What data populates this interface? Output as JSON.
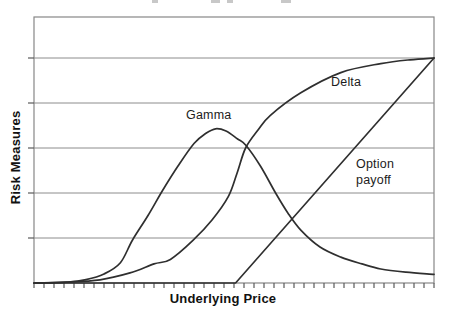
{
  "figure": {
    "background": "#ffffff",
    "frame_color": "#878787",
    "grid_color": "#8c8c8c",
    "tick_color": "#5a5a5a",
    "curve_color": "#2f2f2f",
    "text_color": "#1c1c1c"
  },
  "labels": {
    "y_axis": "Risk Measures",
    "x_axis": "Underlying Price",
    "delta": "Delta",
    "gamma": "Gamma",
    "payoff": "Option\npayoff"
  },
  "chart_data": {
    "type": "line",
    "title": "",
    "xlabel": "Underlying Price",
    "ylabel": "Risk Measures",
    "grid": "horizontal-only",
    "legend": "inline-annotations",
    "x_axis": {
      "range": [
        0,
        100
      ],
      "tick_count": 41,
      "tick_labels": "none"
    },
    "y_axis": {
      "range": [
        0,
        1.182
      ],
      "gridlines": [
        0.2,
        0.4,
        0.6,
        0.8,
        1.0
      ],
      "tick_labels": "none"
    },
    "series": [
      {
        "name": "Delta",
        "smooth": true,
        "points": [
          [
            0,
            0
          ],
          [
            8,
            0.004
          ],
          [
            16.5,
            0.014
          ],
          [
            24,
            0.045
          ],
          [
            30,
            0.085
          ],
          [
            34.1,
            0.105
          ],
          [
            39.8,
            0.19
          ],
          [
            44.5,
            0.28
          ],
          [
            48.6,
            0.385
          ],
          [
            50.8,
            0.49
          ],
          [
            52.9,
            0.6
          ],
          [
            56,
            0.68
          ],
          [
            59.1,
            0.745
          ],
          [
            66.7,
            0.845
          ],
          [
            76.7,
            0.935
          ],
          [
            86.7,
            0.975
          ],
          [
            94,
            0.992
          ],
          [
            100,
            1.0
          ]
        ]
      },
      {
        "name": "Gamma",
        "smooth": true,
        "points": [
          [
            0,
            0
          ],
          [
            8.5,
            0.004
          ],
          [
            13,
            0.015
          ],
          [
            17.5,
            0.04
          ],
          [
            21.6,
            0.09
          ],
          [
            24.6,
            0.19
          ],
          [
            28.5,
            0.3
          ],
          [
            32.1,
            0.41
          ],
          [
            36,
            0.52
          ],
          [
            40,
            0.62
          ],
          [
            43,
            0.665
          ],
          [
            45.4,
            0.685
          ],
          [
            48,
            0.675
          ],
          [
            50.9,
            0.64
          ],
          [
            52.9,
            0.613
          ],
          [
            56.6,
            0.52
          ],
          [
            60.4,
            0.4
          ],
          [
            63.5,
            0.31
          ],
          [
            66.7,
            0.235
          ],
          [
            71.5,
            0.16
          ],
          [
            76.7,
            0.115
          ],
          [
            82,
            0.085
          ],
          [
            86.7,
            0.062
          ],
          [
            93,
            0.048
          ],
          [
            100,
            0.038
          ]
        ]
      },
      {
        "name": "Option payoff",
        "smooth": false,
        "points": [
          [
            0,
            0
          ],
          [
            50.4,
            0
          ],
          [
            100,
            1.0
          ]
        ]
      }
    ]
  }
}
